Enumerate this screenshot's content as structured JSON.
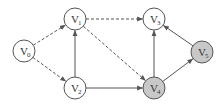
{
  "diagram": {
    "type": "directed-graph",
    "colors": {
      "background": "#ffffff",
      "stroke": "#555555",
      "node_fill_default": "#ffffff",
      "node_fill_highlight": "#c8c8c8"
    },
    "nodes": [
      {
        "id": "V0",
        "label": "V",
        "sub": "0",
        "x": 24,
        "y": 51,
        "highlight": false
      },
      {
        "id": "V1",
        "label": "V",
        "sub": "1",
        "x": 75,
        "y": 19,
        "highlight": false
      },
      {
        "id": "V2",
        "label": "V",
        "sub": "2",
        "x": 75,
        "y": 88,
        "highlight": false
      },
      {
        "id": "V3",
        "label": "V",
        "sub": "3",
        "x": 154,
        "y": 19,
        "highlight": false
      },
      {
        "id": "V4",
        "label": "V",
        "sub": "4",
        "x": 154,
        "y": 88,
        "highlight": true
      },
      {
        "id": "V5",
        "label": "V",
        "sub": "5",
        "x": 202,
        "y": 52,
        "highlight": true
      }
    ],
    "edges": [
      {
        "from": "V0",
        "to": "V1",
        "style": "dashed"
      },
      {
        "from": "V0",
        "to": "V2",
        "style": "dashed"
      },
      {
        "from": "V1",
        "to": "V3",
        "style": "dashed"
      },
      {
        "from": "V1",
        "to": "V4",
        "style": "dashed"
      },
      {
        "from": "V2",
        "to": "V1",
        "style": "solid"
      },
      {
        "from": "V2",
        "to": "V4",
        "style": "solid"
      },
      {
        "from": "V4",
        "to": "V3",
        "style": "solid"
      },
      {
        "from": "V4",
        "to": "V5",
        "style": "solid"
      },
      {
        "from": "V5",
        "to": "V3",
        "style": "solid"
      }
    ]
  }
}
